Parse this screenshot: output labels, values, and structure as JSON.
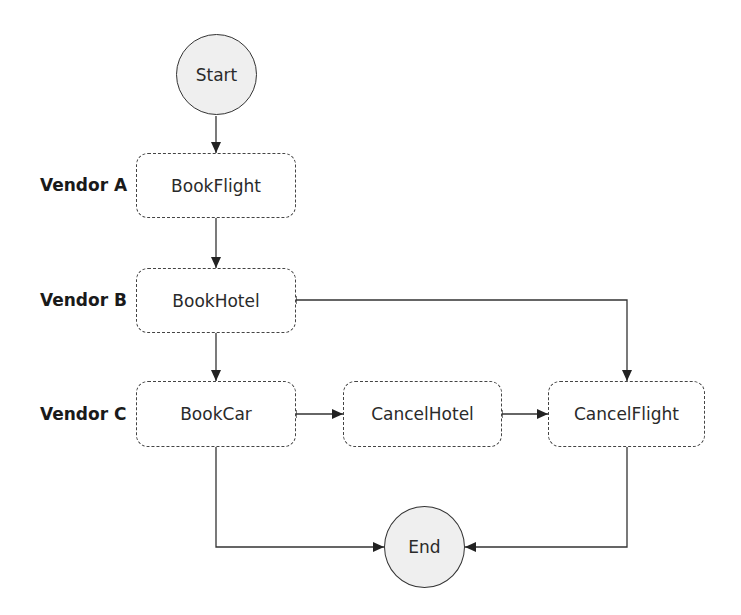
{
  "diagram": {
    "type": "flowchart",
    "lanes": [
      {
        "label": "Vendor A"
      },
      {
        "label": "Vendor B"
      },
      {
        "label": "Vendor C"
      }
    ],
    "nodes": {
      "start": {
        "label": "Start",
        "shape": "circle"
      },
      "book_flight": {
        "label": "BookFlight",
        "shape": "dashed-rounded-rect",
        "lane": "Vendor A"
      },
      "book_hotel": {
        "label": "BookHotel",
        "shape": "dashed-rounded-rect",
        "lane": "Vendor B"
      },
      "book_car": {
        "label": "BookCar",
        "shape": "dashed-rounded-rect",
        "lane": "Vendor C"
      },
      "cancel_hotel": {
        "label": "CancelHotel",
        "shape": "dashed-rounded-rect",
        "lane": "Vendor C"
      },
      "cancel_flight": {
        "label": "CancelFlight",
        "shape": "dashed-rounded-rect",
        "lane": "Vendor C"
      },
      "end": {
        "label": "End",
        "shape": "circle"
      }
    },
    "edges": [
      {
        "from": "Start",
        "to": "BookFlight"
      },
      {
        "from": "BookFlight",
        "to": "BookHotel"
      },
      {
        "from": "BookHotel",
        "to": "BookCar"
      },
      {
        "from": "BookHotel",
        "to": "CancelFlight"
      },
      {
        "from": "BookCar",
        "to": "CancelHotel"
      },
      {
        "from": "CancelHotel",
        "to": "CancelFlight"
      },
      {
        "from": "BookCar",
        "to": "End"
      },
      {
        "from": "CancelFlight",
        "to": "End"
      }
    ],
    "colors": {
      "circle_fill": "#efefef",
      "stroke": "#333333",
      "dash": "#444444"
    }
  }
}
